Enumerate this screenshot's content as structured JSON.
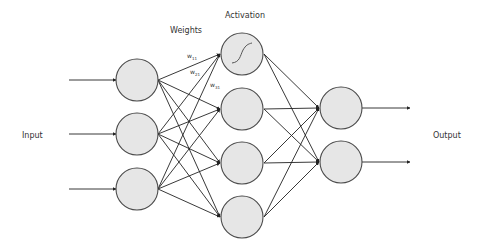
{
  "diagram": {
    "type": "feedforward-neural-network",
    "labels": {
      "input": "Input",
      "output": "Output",
      "weights": "Weights",
      "activation": "Activation"
    },
    "weight_labels": [
      {
        "base": "w",
        "sub": "11"
      },
      {
        "base": "w",
        "sub": "21"
      },
      {
        "base": "w",
        "sub": "31"
      }
    ],
    "layers": [
      {
        "name": "input",
        "nodes": 3
      },
      {
        "name": "hidden",
        "nodes": 4,
        "activation_icon": "sigmoid-curve"
      },
      {
        "name": "output",
        "nodes": 2
      }
    ],
    "connections": "fully-connected",
    "colors": {
      "node_fill": "#e6e6e6",
      "node_stroke": "#4a4a4a",
      "edge": "#222222",
      "text": "#333333"
    }
  }
}
